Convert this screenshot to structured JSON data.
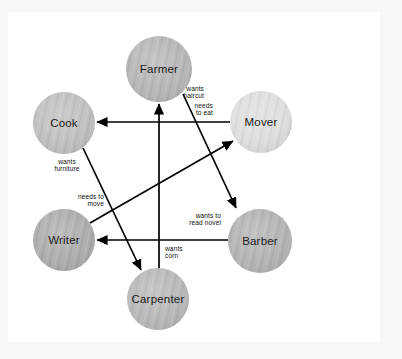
{
  "figure": {
    "background_color": "#f7f7f7",
    "plate_color": "#ffffff",
    "edge_color": "#000000"
  },
  "nodes": [
    {
      "id": "farmer",
      "label": "Farmer",
      "cx": 159,
      "cy": 69,
      "r": 33,
      "fill": "#b3b3b3"
    },
    {
      "id": "cook",
      "label": "Cook",
      "cx": 64,
      "cy": 123,
      "r": 31,
      "fill": "#bdbdbd"
    },
    {
      "id": "mover",
      "label": "Mover",
      "cx": 261,
      "cy": 122,
      "r": 31,
      "fill": "#dcdcdc"
    },
    {
      "id": "writer",
      "label": "Writer",
      "cx": 64,
      "cy": 240,
      "r": 31,
      "fill": "#a9a9a9"
    },
    {
      "id": "barber",
      "label": "Barber",
      "cx": 260,
      "cy": 241,
      "r": 32,
      "fill": "#b0b0b0"
    },
    {
      "id": "carpenter",
      "label": "Carpenter",
      "cx": 158,
      "cy": 299,
      "r": 31,
      "fill": "#b5b5b5"
    }
  ],
  "edges": [
    {
      "id": "mover-to-cook",
      "from": "mover",
      "to": "cook",
      "label_lines": [
        "needs",
        "to eat"
      ],
      "label_x": 213,
      "label_y": 108,
      "label_anchor": "end",
      "x1": 230,
      "y1": 122,
      "x2": 97,
      "y2": 122
    },
    {
      "id": "farmer-to-barber",
      "from": "farmer",
      "to": "barber",
      "label_lines": [
        "wants",
        "haircut"
      ],
      "label_x": 204,
      "label_y": 91,
      "label_anchor": "end",
      "x1": 183,
      "y1": 94,
      "x2": 236,
      "y2": 208
    },
    {
      "id": "cook-to-carpenter",
      "from": "cook",
      "to": "carpenter",
      "label_lines": [
        "wants",
        "furniture"
      ],
      "label_x": 67,
      "label_y": 164,
      "label_anchor": "middle",
      "x1": 83,
      "y1": 148,
      "x2": 141,
      "y2": 270
    },
    {
      "id": "writer-to-mover",
      "from": "writer",
      "to": "mover",
      "label_lines": [
        "needs to",
        "move"
      ],
      "label_x": 104,
      "label_y": 199,
      "label_anchor": "end",
      "x1": 90,
      "y1": 223,
      "x2": 233,
      "y2": 141
    },
    {
      "id": "barber-to-writer",
      "from": "barber",
      "to": "writer",
      "label_lines": [
        "wants to",
        "read novel"
      ],
      "label_x": 221,
      "label_y": 218,
      "label_anchor": "end",
      "x1": 228,
      "y1": 240,
      "x2": 97,
      "y2": 240
    },
    {
      "id": "carpenter-to-farmer",
      "from": "carpenter",
      "to": "farmer",
      "label_lines": [
        "wants",
        "corn"
      ],
      "label_x": 165,
      "label_y": 251,
      "label_anchor": "start",
      "x1": 159,
      "y1": 268,
      "x2": 159,
      "y2": 104
    }
  ]
}
